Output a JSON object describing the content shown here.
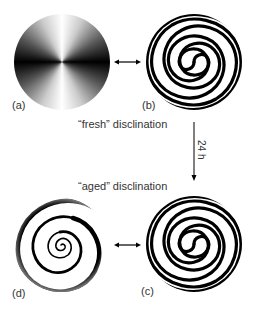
{
  "panels": [
    {
      "id": "a",
      "label": "(a)",
      "pattern": "conic-brush"
    },
    {
      "id": "b",
      "label": "(b)",
      "pattern": "double-spiral-fine"
    },
    {
      "id": "c",
      "label": "(c)",
      "pattern": "double-spiral-fine"
    },
    {
      "id": "d",
      "label": "(d)",
      "pattern": "tight-spiral-aged"
    }
  ],
  "captions": {
    "fresh": "“fresh” disclination",
    "aged": "“aged” disclination",
    "time": "24 h"
  },
  "arrows": [
    {
      "from": "a",
      "to": "b",
      "type": "double-headed"
    },
    {
      "from": "d",
      "to": "c",
      "type": "double-headed"
    },
    {
      "from": "fresh",
      "to": "aged",
      "type": "single",
      "label": "24 h"
    }
  ]
}
